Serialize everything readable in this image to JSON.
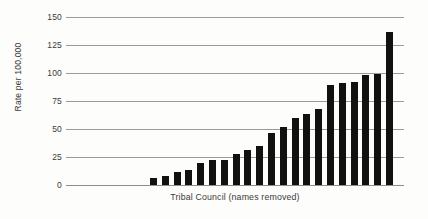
{
  "chart_data": {
    "type": "bar",
    "title": "",
    "subtitle": "",
    "xlabel": "Tribal Council (names removed)",
    "ylabel": "Rate per 100,000",
    "ylim": [
      0,
      150
    ],
    "xlim": [
      0,
      22
    ],
    "grid": true,
    "legend": null,
    "legend_position": "none",
    "bar_color": "#111110",
    "gridline_color": "#9a9a97",
    "text_color": "#3b3b39",
    "ytick_labels": [
      "150",
      "125",
      "100",
      "75",
      "50",
      "25",
      "0"
    ],
    "ytick_values": [
      150,
      125,
      100,
      75,
      50,
      25,
      0
    ],
    "xtick_labels": [],
    "categories": [
      "1",
      "2",
      "3",
      "4",
      "5",
      "6",
      "7",
      "8",
      "9",
      "10",
      "11",
      "12",
      "13",
      "14",
      "15",
      "16",
      "17",
      "18",
      "19",
      "20",
      "21"
    ],
    "values": [
      6,
      8,
      12,
      13,
      20,
      22,
      22,
      28,
      31,
      35,
      46,
      52,
      60,
      63,
      68,
      89,
      91,
      92,
      98,
      99,
      137
    ],
    "annotations": []
  }
}
